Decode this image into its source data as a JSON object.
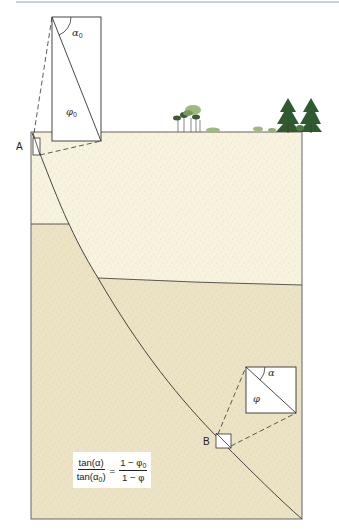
{
  "figure": {
    "type": "geologic cross-section: compaction of a dipping fault/layer with depth",
    "colors": {
      "upper_layer": "#f7f3de",
      "lower_layer": "#ece3c4",
      "line": "#333333",
      "top_rule": "#8fa3b8",
      "tree_dark": "#2f5a2f",
      "tree_light": "#8fb070"
    }
  },
  "labels": {
    "point_a": "A",
    "point_b": "B",
    "inset_top_angle": "α",
    "inset_top_angle_sub": "0",
    "inset_top_porosity": "φ",
    "inset_top_porosity_sub": "0",
    "inset_bottom_angle": "α",
    "inset_bottom_porosity": "φ"
  },
  "formula": {
    "lhs_num": "tan(α)",
    "lhs_den_prefix": "tan(α",
    "lhs_den_sub": "0",
    "lhs_den_suffix": ")",
    "equals": "=",
    "rhs_num_prefix": "1 − φ",
    "rhs_num_sub": "0",
    "rhs_den": "1 − φ"
  }
}
